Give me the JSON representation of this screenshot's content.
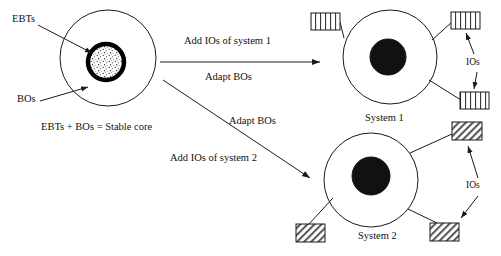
{
  "figure": {
    "type": "concept-diagram",
    "background_color": "#ffffff",
    "stroke_color": "#1a1a1a"
  },
  "source_system": {
    "outer_circle_label": "",
    "ebts_label": "EBTs",
    "bos_label": "BOs",
    "caption": "EBTs + BOs = Stable core",
    "core_fill": "speckled",
    "outer_center": [
      108,
      58
    ],
    "outer_radius": 48,
    "core_center": [
      106,
      62
    ],
    "core_radius": 18
  },
  "transitions": [
    {
      "id": "to-system-1",
      "line_1": "Add IOs of system 1",
      "line_2": "Adapt BOs",
      "direction": "horizontal-right"
    },
    {
      "id": "to-system-2",
      "line_1": "Adapt BOs",
      "line_2": "Add IOs of system 2",
      "direction": "diagonal-down-right"
    }
  ],
  "systems": [
    {
      "id": "system-1",
      "name": "System 1",
      "ios_label": "IOs",
      "core_fill": "solid-black",
      "io_boxes": 3,
      "io_pattern": "vertical-stripes",
      "center": [
        390,
        57
      ],
      "radius": 47,
      "core_radius": 18
    },
    {
      "id": "system-2",
      "name": "System 2",
      "ios_label": "IOs",
      "core_fill": "solid-black",
      "io_boxes": 3,
      "io_pattern": "diagonal-hatch",
      "center": [
        371,
        180
      ],
      "radius": 47,
      "core_radius": 19
    }
  ]
}
